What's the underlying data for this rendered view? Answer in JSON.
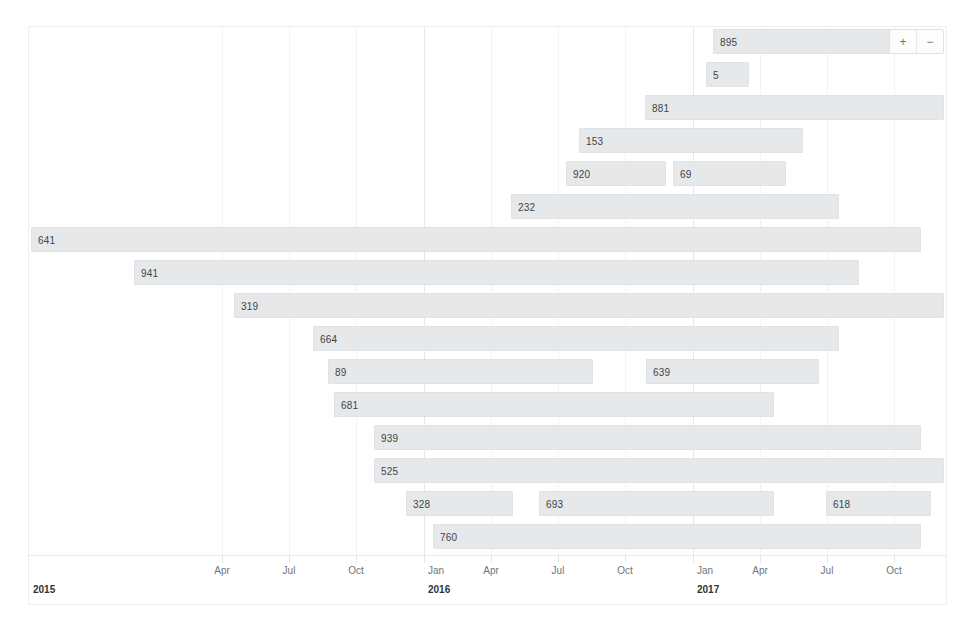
{
  "chart_data": {
    "type": "bar",
    "subtype": "gantt-timeline",
    "title": "",
    "xlabel": "",
    "ylabel": "",
    "grid": true,
    "legend_position": "none",
    "x_axis": {
      "type": "time",
      "range": [
        "2015-01-15",
        "2018-06-01"
      ],
      "year_labels": [
        "2015",
        "2016",
        "2017",
        "2018"
      ],
      "month_ticks": [
        "Apr",
        "Jul",
        "Oct",
        "Jan",
        "Apr",
        "Jul",
        "Oct",
        "Jan",
        "Apr",
        "Jul",
        "Oct",
        "Jan",
        "Apr"
      ]
    },
    "rows": [
      {
        "row": 1,
        "bars": [
          {
            "label": "895",
            "x": 712,
            "width": 196
          }
        ]
      },
      {
        "row": 2,
        "bars": [
          {
            "label": "5",
            "x": 705,
            "width": 43
          }
        ]
      },
      {
        "row": 3,
        "bars": [
          {
            "label": "881",
            "x": 644,
            "width": 299
          }
        ]
      },
      {
        "row": 4,
        "bars": [
          {
            "label": "153",
            "x": 578,
            "width": 224
          }
        ]
      },
      {
        "row": 5,
        "bars": [
          {
            "label": "920",
            "x": 565,
            "width": 100
          },
          {
            "label": "69",
            "x": 672,
            "width": 113
          }
        ]
      },
      {
        "row": 6,
        "bars": [
          {
            "label": "232",
            "x": 510,
            "width": 328
          }
        ]
      },
      {
        "row": 7,
        "bars": [
          {
            "label": "641",
            "x": 30,
            "width": 890
          }
        ]
      },
      {
        "row": 8,
        "bars": [
          {
            "label": "941",
            "x": 133,
            "width": 725
          }
        ]
      },
      {
        "row": 9,
        "bars": [
          {
            "label": "319",
            "x": 233,
            "width": 710
          }
        ]
      },
      {
        "row": 10,
        "bars": [
          {
            "label": "664",
            "x": 312,
            "width": 526
          }
        ]
      },
      {
        "row": 11,
        "bars": [
          {
            "label": "89",
            "x": 327,
            "width": 265
          },
          {
            "label": "639",
            "x": 645,
            "width": 173
          }
        ]
      },
      {
        "row": 12,
        "bars": [
          {
            "label": "681",
            "x": 333,
            "width": 440
          }
        ]
      },
      {
        "row": 13,
        "bars": [
          {
            "label": "939",
            "x": 373,
            "width": 547
          }
        ]
      },
      {
        "row": 14,
        "bars": [
          {
            "label": "525",
            "x": 373,
            "width": 570
          }
        ]
      },
      {
        "row": 15,
        "bars": [
          {
            "label": "328",
            "x": 405,
            "width": 107
          },
          {
            "label": "693",
            "x": 538,
            "width": 235
          },
          {
            "label": "618",
            "x": 825,
            "width": 105
          }
        ]
      },
      {
        "row": 16,
        "bars": [
          {
            "label": "760",
            "x": 432,
            "width": 488
          }
        ]
      }
    ],
    "values": [
      895,
      5,
      881,
      153,
      920,
      69,
      232,
      641,
      941,
      319,
      664,
      89,
      639,
      681,
      939,
      525,
      328,
      693,
      618,
      760
    ],
    "bar_color": "#e6e8ea",
    "bar_border_color": "#e0e3e5",
    "label_color": "#3f4548"
  },
  "controls": {
    "zoom_in_label": "+",
    "zoom_out_label": "−"
  },
  "axis": {
    "ticks": [
      {
        "label": "Apr",
        "x": 221,
        "is_year": false
      },
      {
        "label": "Jul",
        "x": 288,
        "is_year": false
      },
      {
        "label": "Oct",
        "x": 355,
        "is_year": false
      },
      {
        "label": "Jan",
        "x": 423,
        "is_year": true,
        "year": "2016"
      },
      {
        "label": "Apr",
        "x": 490,
        "is_year": false
      },
      {
        "label": "Jul",
        "x": 557,
        "is_year": false
      },
      {
        "label": "Oct",
        "x": 624,
        "is_year": false
      },
      {
        "label": "Jan",
        "x": 692,
        "is_year": true,
        "year": "2017"
      },
      {
        "label": "Apr",
        "x": 759,
        "is_year": false
      },
      {
        "label": "Jul",
        "x": 826,
        "is_year": false
      },
      {
        "label": "Oct",
        "x": 893,
        "is_year": false
      },
      {
        "label": "Jan",
        "x": 961,
        "is_year": true,
        "year": "2018"
      },
      {
        "label": "Apr",
        "x": 1028,
        "is_year": false
      }
    ],
    "first_year": "2015"
  }
}
